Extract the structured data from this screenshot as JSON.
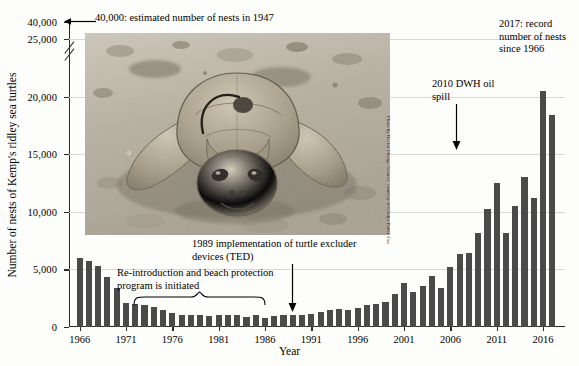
{
  "figure": {
    "background_color": "#fdfdfb",
    "bar_color": "#4a4a4a",
    "grid_color": "#d9d9d4",
    "axis_color": "#2a2a2a"
  },
  "axes": {
    "x_title": "Year",
    "y_title": "Number of nests of Kemp's ridley sea turtles",
    "y_ticks": [
      "0",
      "5,000",
      "10,000",
      "15,000",
      "20,000",
      "25,000",
      "40,000"
    ],
    "x_ticks": [
      "1966",
      "1971",
      "1976",
      "1981",
      "1986",
      "1991",
      "1996",
      "2001",
      "2006",
      "2011",
      "2016"
    ],
    "y_break": true
  },
  "annotations": {
    "estimate_1947": "40,000: estimated number of nests in 1947",
    "record_2017": "2017: record number of nests since 1966",
    "dwh_oil_spill": "2010 DWH oil spill",
    "ted": "1989 implementation of turtle excluder devices (TED)",
    "reintroduction": "Re-introduction and beach protection program is initiated"
  },
  "photo": {
    "alt": "Kemp's ridley sea turtle on sand",
    "credit": "Photo by Hector Chenge Alvarez, courtesy of Gladys Porter Zoo"
  },
  "chart_data": {
    "type": "bar",
    "title": "",
    "xlabel": "Year",
    "ylabel": "Number of nests of Kemp's ridley sea turtles",
    "ylim": [
      0,
      25000
    ],
    "y_axis_break_note": "Axis broken between 25,000 and 40,000",
    "grid": true,
    "legend": null,
    "categories": [
      1966,
      1967,
      1968,
      1969,
      1970,
      1971,
      1972,
      1973,
      1974,
      1975,
      1976,
      1977,
      1978,
      1979,
      1980,
      1981,
      1982,
      1983,
      1984,
      1985,
      1986,
      1987,
      1988,
      1989,
      1990,
      1991,
      1992,
      1993,
      1994,
      1995,
      1996,
      1997,
      1998,
      1999,
      2000,
      2001,
      2002,
      2003,
      2004,
      2005,
      2006,
      2007,
      2008,
      2009,
      2010,
      2011,
      2012,
      2013,
      2014,
      2015,
      2016,
      2017
    ],
    "values": [
      6000,
      5700,
      5300,
      4300,
      3400,
      2100,
      2000,
      1900,
      1700,
      1500,
      1200,
      1050,
      1000,
      1000,
      950,
      1000,
      1050,
      1000,
      900,
      1000,
      750,
      950,
      1000,
      1000,
      1050,
      1150,
      1300,
      1450,
      1550,
      1450,
      1650,
      1950,
      2000,
      2150,
      2900,
      3800,
      3000,
      3550,
      4400,
      3400,
      5200,
      6300,
      6400,
      8200,
      10250,
      12500,
      8200,
      10500,
      13000,
      11200,
      20500,
      18400
    ]
  }
}
